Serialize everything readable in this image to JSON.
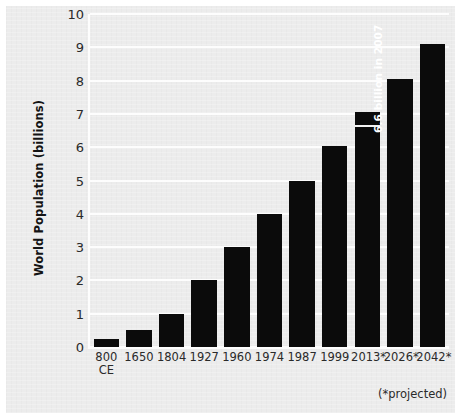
{
  "figure": {
    "background_color": "#ececec",
    "gridline_color": "#fdfdfd",
    "bar_color": "#0b0b0b",
    "footnote": "(*projected)"
  },
  "chart_data": {
    "type": "bar",
    "title": "",
    "xlabel": "",
    "ylabel": "World Population (billions)",
    "ylim": [
      0,
      10
    ],
    "yticks": [
      0,
      1,
      2,
      3,
      4,
      5,
      6,
      7,
      8,
      9,
      10
    ],
    "ytick_labels": [
      "0",
      "1",
      "2",
      "3",
      "4",
      "5",
      "6",
      "7",
      "8",
      "9",
      "10"
    ],
    "grid": true,
    "legend": "none",
    "categories": [
      "800 CE",
      "1650",
      "1804",
      "1927",
      "1960",
      "1974",
      "1987",
      "1999",
      "2013*",
      "2026*",
      "2042*"
    ],
    "category_lines": [
      [
        "800",
        "CE"
      ],
      [
        "1650",
        ""
      ],
      [
        "1804",
        ""
      ],
      [
        "1927",
        ""
      ],
      [
        "1960",
        ""
      ],
      [
        "1974",
        ""
      ],
      [
        "1987",
        ""
      ],
      [
        "1999",
        ""
      ],
      [
        "2013*",
        ""
      ],
      [
        "2026*",
        ""
      ],
      [
        "2042*",
        ""
      ]
    ],
    "values": [
      0.25,
      0.5,
      1.0,
      2.0,
      3.0,
      4.0,
      5.0,
      6.05,
      7.05,
      8.05,
      9.1
    ],
    "annotations": [
      {
        "category": "2013*",
        "text": "6.6 billion in 2007",
        "value": 6.6,
        "style": "white-rotated-inside-bar"
      }
    ],
    "footnote": "(*projected)"
  }
}
